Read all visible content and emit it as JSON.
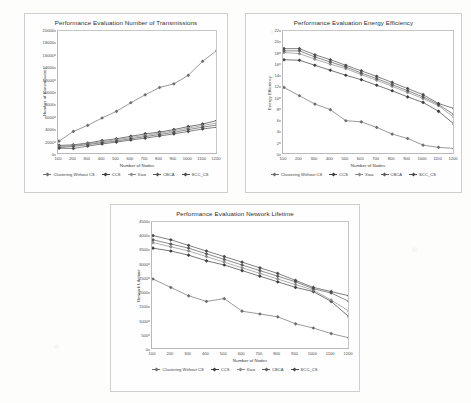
{
  "figure": {
    "panels": [
      "panel-transmissions",
      "panel-energy",
      "panel-lifetime"
    ],
    "background_color": "#fdfdfc",
    "frame_color": "#cfcfcf"
  },
  "series_names": [
    "Clustering Without CS",
    "CCS",
    "Xiao",
    "CBCA",
    "SCC_CS"
  ],
  "series_colors": [
    "#6e6e6e",
    "#3c3c3c",
    "#8c8c8c",
    "#5a5a5a",
    "#4a4a4a"
  ],
  "chart_data": [
    {
      "id": "transmissions",
      "type": "line",
      "title": "Performance Evaluation Number of Transmissions",
      "xlabel": "Number of Nodes",
      "ylabel": "Number of transmissions",
      "x": [
        100,
        200,
        300,
        400,
        500,
        600,
        700,
        800,
        900,
        1000,
        1100,
        1200
      ],
      "xlim": [
        100,
        1200
      ],
      "ylim": [
        0,
        20000
      ],
      "yticks": [
        0,
        2000,
        4000,
        6000,
        8000,
        10000,
        12000,
        14000,
        16000,
        18000,
        20000
      ],
      "xticks": [
        100,
        200,
        300,
        400,
        500,
        600,
        700,
        800,
        900,
        1000,
        1100,
        1200
      ],
      "grid": false,
      "legend_position": "bottom",
      "series": [
        {
          "name": "Clustering Without CS",
          "values": [
            2100,
            3700,
            4700,
            5900,
            7000,
            8400,
            9700,
            10900,
            11500,
            12900,
            15200,
            17000
          ]
        },
        {
          "name": "CCS",
          "values": [
            1400,
            1500,
            1800,
            2200,
            2500,
            2900,
            3300,
            3600,
            4000,
            4500,
            4900,
            5500
          ]
        },
        {
          "name": "Xiao",
          "values": [
            1200,
            1400,
            1700,
            2000,
            2350,
            2700,
            3050,
            3400,
            3800,
            4250,
            4650,
            5100
          ]
        },
        {
          "name": "CBCA",
          "values": [
            1050,
            1250,
            1550,
            1850,
            2150,
            2500,
            2850,
            3200,
            3550,
            4000,
            4400,
            4750
          ]
        },
        {
          "name": "SCC_CS",
          "values": [
            950,
            900,
            1300,
            1650,
            1950,
            2300,
            2600,
            2950,
            3300,
            3700,
            4100,
            4400
          ]
        }
      ]
    },
    {
      "id": "energy",
      "type": "line",
      "title": "Performance Evaluation Energy Efficiency",
      "xlabel": "Number of Nodes",
      "ylabel": "Energy Efficiency",
      "x": [
        100,
        200,
        300,
        400,
        500,
        600,
        700,
        800,
        900,
        1000,
        1100,
        1200
      ],
      "xlim": [
        100,
        1200
      ],
      "ylim": [
        0,
        22
      ],
      "yticks": [
        0,
        2,
        4,
        6,
        8,
        10,
        12,
        14,
        16,
        18,
        20,
        22
      ],
      "xticks": [
        100,
        200,
        300,
        400,
        500,
        600,
        700,
        800,
        900,
        1000,
        1100,
        1200
      ],
      "grid": false,
      "legend_position": "bottom",
      "series": [
        {
          "name": "Clustering Without CS",
          "values": [
            12.0,
            10.5,
            9.0,
            8.0,
            6.0,
            5.8,
            4.8,
            3.6,
            2.8,
            1.6,
            1.2,
            1.0
          ]
        },
        {
          "name": "CCS",
          "values": [
            17.0,
            16.9,
            16.0,
            15.1,
            14.2,
            13.4,
            12.4,
            11.4,
            10.3,
            9.3,
            7.7,
            5.4
          ]
        },
        {
          "name": "Xiao",
          "values": [
            18.3,
            18.1,
            17.1,
            16.2,
            15.4,
            14.3,
            13.3,
            12.2,
            11.1,
            10.0,
            8.7,
            6.6
          ]
        },
        {
          "name": "CBCA",
          "values": [
            18.6,
            18.6,
            17.5,
            16.6,
            15.7,
            14.6,
            13.6,
            12.5,
            11.4,
            10.3,
            8.9,
            7.1
          ]
        },
        {
          "name": "SCC_CS",
          "values": [
            19.0,
            19.0,
            17.9,
            17.0,
            16.0,
            15.0,
            14.0,
            12.9,
            11.8,
            10.7,
            9.1,
            8.2
          ]
        }
      ]
    },
    {
      "id": "lifetime",
      "type": "line",
      "title": "Performance Evaluation Network Lifetime",
      "xlabel": "Number of Nodes",
      "ylabel": "Network Lifetime",
      "x": [
        100,
        200,
        300,
        400,
        500,
        600,
        700,
        800,
        900,
        1000,
        1100,
        1200
      ],
      "xlim": [
        100,
        1200
      ],
      "ylim": [
        0,
        4500
      ],
      "yticks": [
        0,
        500,
        1000,
        1500,
        2000,
        2500,
        3000,
        3500,
        4000,
        4500
      ],
      "xticks": [
        100,
        200,
        300,
        400,
        500,
        600,
        700,
        800,
        900,
        1000,
        1100,
        1200
      ],
      "grid": false,
      "legend_position": "bottom",
      "series": [
        {
          "name": "Clustering Without CS",
          "values": [
            2500,
            2200,
            1900,
            1700,
            1800,
            1350,
            1250,
            1150,
            900,
            750,
            550,
            400
          ]
        },
        {
          "name": "CCS",
          "values": [
            3600,
            3500,
            3350,
            3150,
            3000,
            2800,
            2600,
            2400,
            2200,
            2050,
            1700,
            1150
          ]
        },
        {
          "name": "Xiao",
          "values": [
            3800,
            3650,
            3500,
            3300,
            3100,
            2900,
            2700,
            2500,
            2300,
            2100,
            1750,
            1350
          ]
        },
        {
          "name": "CBCA",
          "values": [
            3900,
            3750,
            3600,
            3400,
            3200,
            3000,
            2800,
            2600,
            2400,
            2150,
            2000,
            1700
          ]
        },
        {
          "name": "SCC_CS",
          "values": [
            4050,
            3900,
            3700,
            3500,
            3300,
            3100,
            2900,
            2700,
            2450,
            2200,
            2050,
            1900
          ]
        }
      ]
    }
  ]
}
